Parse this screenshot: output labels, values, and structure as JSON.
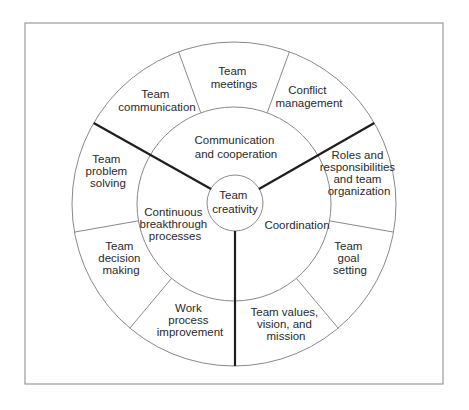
{
  "diagram": {
    "center": {
      "label_lines": [
        "Team",
        "creativity"
      ]
    },
    "inner_segments": [
      {
        "id": "communication-cooperation",
        "label_lines": [
          "Communication",
          "and cooperation"
        ]
      },
      {
        "id": "coordination",
        "label_lines": [
          "Coordination"
        ]
      },
      {
        "id": "continuous-breakthrough",
        "label_lines": [
          "Continuous",
          "breakthrough",
          "processes"
        ]
      }
    ],
    "outer_segments": [
      {
        "id": "team-meetings",
        "label_lines": [
          "Team",
          "meetings"
        ]
      },
      {
        "id": "conflict-management",
        "label_lines": [
          "Conflict",
          "management"
        ]
      },
      {
        "id": "roles-responsibilities",
        "label_lines": [
          "Roles and",
          "responsibilities",
          "and team",
          "organization"
        ]
      },
      {
        "id": "team-goal-setting",
        "label_lines": [
          "Team",
          "goal",
          "setting"
        ]
      },
      {
        "id": "team-values",
        "label_lines": [
          "Team values,",
          "vision, and",
          "mission"
        ]
      },
      {
        "id": "work-process-improvement",
        "label_lines": [
          "Work",
          "process",
          "improvement"
        ]
      },
      {
        "id": "team-decision-making",
        "label_lines": [
          "Team",
          "decision",
          "making"
        ]
      },
      {
        "id": "team-problem-solving",
        "label_lines": [
          "Team",
          "problem",
          "solving"
        ]
      },
      {
        "id": "team-communication",
        "label_lines": [
          "Team",
          "communication"
        ]
      }
    ],
    "colors": {
      "line": "#8a8a8a",
      "spoke": "#1e1e1e",
      "text": "#2a2a2a",
      "frame": "#9a9a9a"
    }
  }
}
